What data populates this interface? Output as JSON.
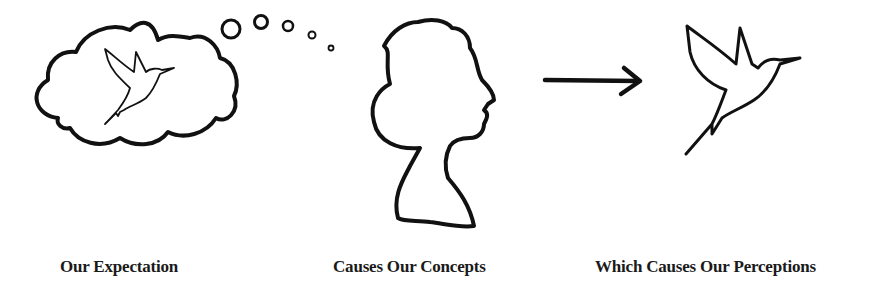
{
  "diagram": {
    "stages": [
      {
        "id": "expectation",
        "caption": "Our Expectation",
        "figure": "thought-cloud-with-hummingbird"
      },
      {
        "id": "concepts",
        "caption": "Causes Our Concepts",
        "figure": "woman-silhouette-profile"
      },
      {
        "id": "perceptions",
        "caption": "Which Causes Our Perceptions",
        "figure": "hummingbird-outline"
      }
    ],
    "connector": "right-arrow",
    "colors": {
      "ink": "#111111",
      "background": "#ffffff"
    }
  }
}
